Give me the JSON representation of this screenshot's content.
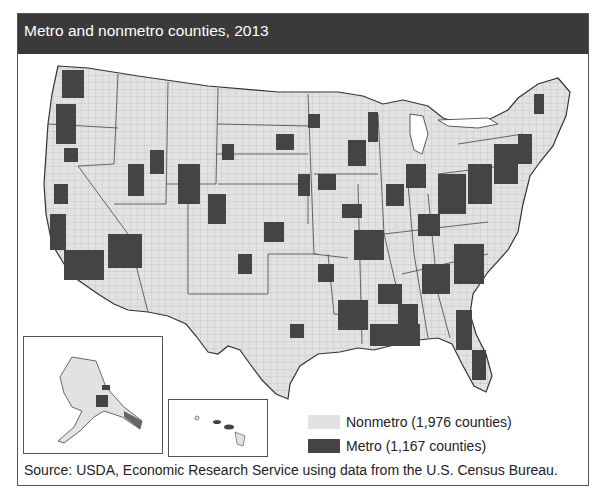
{
  "title": "Metro and nonmetro counties, 2013",
  "legend": {
    "items": [
      {
        "label": "Nonmetro (1,976 counties)",
        "color": "#e2e2e2"
      },
      {
        "label": "Metro (1,167 counties)",
        "color": "#444444"
      }
    ]
  },
  "source": "Source: USDA, Economic Research Service using data from the U.S. Census Bureau.",
  "colors": {
    "titlebar": "#3a3a3a",
    "nonmetro": "#e2e2e2",
    "metro": "#444444",
    "border": "#555555"
  },
  "map": {
    "subject": "United States counties classified as metro or nonmetro",
    "insets": [
      "Alaska",
      "Hawaii"
    ]
  }
}
